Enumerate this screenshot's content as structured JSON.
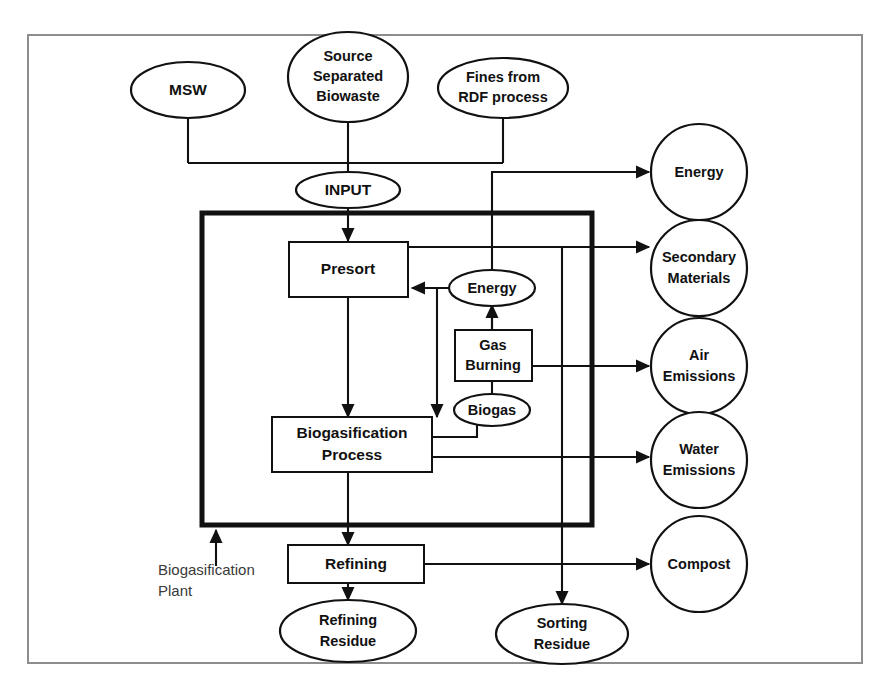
{
  "figure": {
    "frame_color": "#8d8d8d",
    "line_color": "#111111",
    "background": "#ffffff"
  },
  "inputs": [
    {
      "id": "msw",
      "label": "MSW",
      "shape": "ellipse"
    },
    {
      "id": "ssb",
      "label_line1": "Source",
      "label_line2": "Separated",
      "label_line3": "Biowaste",
      "shape": "ellipse"
    },
    {
      "id": "fines",
      "label_line1": "Fines from",
      "label_line2": "RDF process",
      "shape": "ellipse"
    }
  ],
  "input_node": {
    "id": "input",
    "label": "INPUT",
    "shape": "ellipse"
  },
  "plant": {
    "boundary_label_line1": "Biogasification",
    "boundary_label_line2": "Plant",
    "processes": [
      {
        "id": "presort",
        "label": "Presort",
        "shape": "rect"
      },
      {
        "id": "biogasification",
        "label_line1": "Biogasification",
        "label_line2": "Process",
        "shape": "rect"
      },
      {
        "id": "gas_burning",
        "label_line1": "Gas",
        "label_line2": "Burning",
        "shape": "rect"
      }
    ],
    "intermediates": [
      {
        "id": "energy_internal",
        "label": "Energy",
        "shape": "ellipse"
      },
      {
        "id": "biogas",
        "label": "Biogas",
        "shape": "ellipse"
      }
    ]
  },
  "post_process": [
    {
      "id": "refining",
      "label": "Refining",
      "shape": "rect"
    }
  ],
  "outputs": [
    {
      "id": "energy",
      "label": "Energy",
      "shape": "circle"
    },
    {
      "id": "secondary_materials",
      "label_line1": "Secondary",
      "label_line2": "Materials",
      "shape": "circle"
    },
    {
      "id": "air_emissions",
      "label_line1": "Air",
      "label_line2": "Emissions",
      "shape": "circle"
    },
    {
      "id": "water_emissions",
      "label_line1": "Water",
      "label_line2": "Emissions",
      "shape": "circle"
    },
    {
      "id": "compost",
      "label": "Compost",
      "shape": "circle"
    }
  ],
  "residues": [
    {
      "id": "refining_residue",
      "label_line1": "Refining",
      "label_line2": "Residue",
      "shape": "ellipse"
    },
    {
      "id": "sorting_residue",
      "label_line1": "Sorting",
      "label_line2": "Residue",
      "shape": "ellipse"
    }
  ]
}
